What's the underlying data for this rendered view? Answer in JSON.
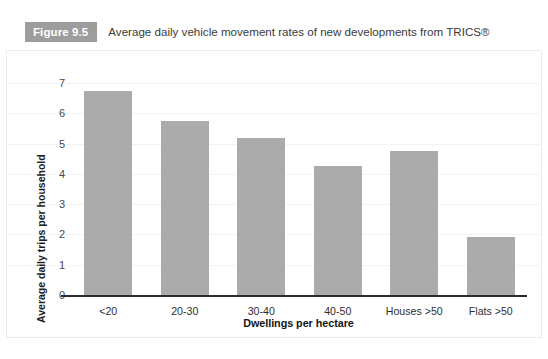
{
  "caption": {
    "figure_number": "Figure 9.5",
    "text": "Average daily vehicle movement rates of new developments from TRICS®"
  },
  "colors": {
    "bar_fill": "#ababab",
    "badge_bg": "#9d9d9d",
    "axis_line": "#2b2b2b",
    "gridline": "#f3f3f3",
    "frame_border": "#ececec"
  },
  "chart_data": {
    "type": "bar",
    "title": "Average daily vehicle movement rates of new developments from TRICS®",
    "xlabel": "Dwellings per hectare",
    "ylabel": "Average daily trips per household",
    "categories": [
      "<20",
      "20-30",
      "30-40",
      "40-50",
      "Houses >50",
      "Flats >50"
    ],
    "values": [
      6.75,
      5.75,
      5.2,
      4.25,
      4.75,
      1.9
    ],
    "ylim": [
      0,
      7
    ],
    "yticks": [
      0,
      1,
      2,
      3,
      4,
      5,
      6,
      7
    ],
    "ytick_labels": [
      "0",
      "1",
      "2",
      "3",
      "4",
      "5",
      "6",
      "7"
    ],
    "grid": true,
    "legend": null,
    "series": [
      {
        "name": "Average daily trips per household",
        "values": [
          6.75,
          5.75,
          5.2,
          4.25,
          4.75,
          1.9
        ]
      }
    ]
  }
}
